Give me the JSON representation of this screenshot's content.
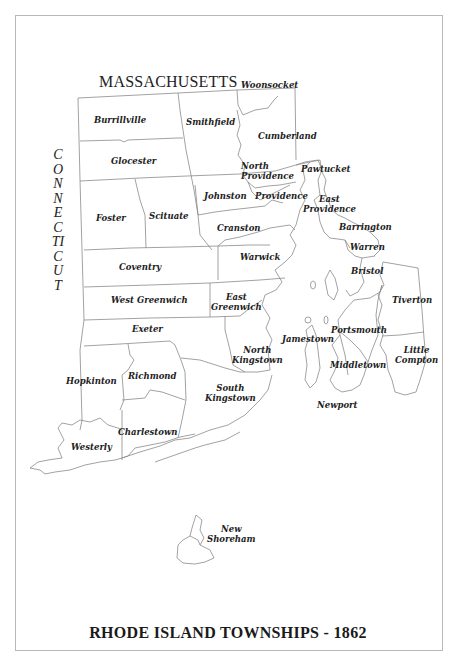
{
  "map": {
    "title": "RHODE ISLAND TOWNSHIPS - 1862",
    "neighbors": {
      "north": "MASSACHUSETTS",
      "west": "CONNECTICUT"
    },
    "towns": [
      {
        "id": "woonsocket",
        "label": "Woonsocket"
      },
      {
        "id": "burrillville",
        "label": "Burrillville"
      },
      {
        "id": "smithfield",
        "label": "Smithfield"
      },
      {
        "id": "cumberland",
        "label": "Cumberland"
      },
      {
        "id": "glocester",
        "label": "Glocester"
      },
      {
        "id": "north-providence",
        "label": "North Providence"
      },
      {
        "id": "pawtucket",
        "label": "Pawtucket"
      },
      {
        "id": "johnston",
        "label": "Johnston"
      },
      {
        "id": "providence",
        "label": "Providence"
      },
      {
        "id": "east-providence",
        "label": "East Providence"
      },
      {
        "id": "foster",
        "label": "Foster"
      },
      {
        "id": "scituate",
        "label": "Scituate"
      },
      {
        "id": "cranston",
        "label": "Cranston"
      },
      {
        "id": "barrington",
        "label": "Barrington"
      },
      {
        "id": "warren",
        "label": "Warren"
      },
      {
        "id": "coventry",
        "label": "Coventry"
      },
      {
        "id": "warwick",
        "label": "Warwick"
      },
      {
        "id": "bristol",
        "label": "Bristol"
      },
      {
        "id": "west-greenwich",
        "label": "West Greenwich"
      },
      {
        "id": "east-greenwich",
        "label": "East Greenwich"
      },
      {
        "id": "tiverton",
        "label": "Tiverton"
      },
      {
        "id": "exeter",
        "label": "Exeter"
      },
      {
        "id": "portsmouth",
        "label": "Portsmouth"
      },
      {
        "id": "north-kingstown",
        "label": "North Kingstown"
      },
      {
        "id": "jamestown",
        "label": "Jamestown"
      },
      {
        "id": "little-compton",
        "label": "Little Compton"
      },
      {
        "id": "middletown",
        "label": "Middletown"
      },
      {
        "id": "hopkinton",
        "label": "Hopkinton"
      },
      {
        "id": "richmond",
        "label": "Richmond"
      },
      {
        "id": "south-kingstown",
        "label": "South Kingstown"
      },
      {
        "id": "newport",
        "label": "Newport"
      },
      {
        "id": "westerly",
        "label": "Westerly"
      },
      {
        "id": "charlestown",
        "label": "Charlestown"
      },
      {
        "id": "new-shoreham",
        "label": "New Shoreham"
      }
    ]
  },
  "labels": {
    "woonsocket": "Woonsocket",
    "burrillville": "Burrillville",
    "smithfield": "Smithfield",
    "cumberland": "Cumberland",
    "glocester": "Glocester",
    "north_providence_1": "North",
    "north_providence_2": "Providence",
    "pawtucket": "Pawtucket",
    "johnston": "Johnston",
    "providence": "Providence",
    "east_providence_1": "East",
    "east_providence_2": "Providence",
    "foster": "Foster",
    "scituate": "Scituate",
    "cranston": "Cranston",
    "barrington": "Barrington",
    "warren": "Warren",
    "coventry": "Coventry",
    "warwick": "Warwick",
    "bristol": "Bristol",
    "west_greenwich": "West Greenwich",
    "east_greenwich_1": "East",
    "east_greenwich_2": "Greenwich",
    "tiverton": "Tiverton",
    "exeter": "Exeter",
    "portsmouth": "Portsmouth",
    "north_kingstown_1": "North",
    "north_kingstown_2": "Kingstown",
    "jamestown": "Jamestown",
    "little_compton_1": "Little",
    "little_compton_2": "Compton",
    "middletown": "Middletown",
    "hopkinton": "Hopkinton",
    "richmond": "Richmond",
    "south_kingstown_1": "South",
    "south_kingstown_2": "Kingstown",
    "newport": "Newport",
    "westerly": "Westerly",
    "charlestown": "Charlestown",
    "new_shoreham_1": "New",
    "new_shoreham_2": "Shoreham"
  },
  "style": {
    "line_color": "#8a8a8a",
    "frame_color": "#b8b8b8",
    "text_color": "#222222"
  }
}
